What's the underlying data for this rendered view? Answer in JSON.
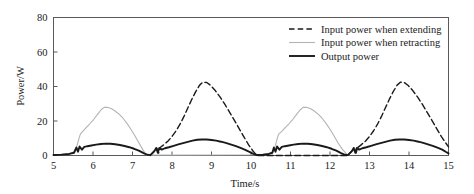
{
  "chart_data": {
    "type": "line",
    "title": "",
    "xlabel": "Time/s",
    "ylabel": "Power/W",
    "xlim": [
      5,
      15
    ],
    "ylim": [
      0,
      80
    ],
    "xticks": [
      "5",
      "6",
      "7",
      "8",
      "9",
      "10",
      "11",
      "12",
      "13",
      "14",
      "15"
    ],
    "yticks": [
      "0",
      "20",
      "40",
      "60",
      "80"
    ],
    "grid": false,
    "legend_position": "top-right",
    "legend": [
      {
        "label": "Input power when extending",
        "style": "dashed",
        "color": "#1a1a1a",
        "width": 1.4
      },
      {
        "label": "Input power when retracting",
        "style": "solid",
        "color": "#b3b3b3",
        "width": 1.1
      },
      {
        "label": "Output power",
        "style": "solid",
        "color": "#1a1a1a",
        "width": 1.9
      }
    ],
    "series": [
      {
        "name": "Input power when extending",
        "style": "dashed",
        "color": "#1a1a1a",
        "comment": "Active only during extension strokes: 7.45-10.15 and 12.45-15.0; peak about 42.5 W",
        "points": [
          [
            7.45,
            0.0
          ],
          [
            7.55,
            2.6
          ],
          [
            7.62,
            4.0
          ],
          [
            7.66,
            1.4
          ],
          [
            7.7,
            4.6
          ],
          [
            7.78,
            6.0
          ],
          [
            7.9,
            8.4
          ],
          [
            8.0,
            11.0
          ],
          [
            8.1,
            14.2
          ],
          [
            8.2,
            18.0
          ],
          [
            8.3,
            22.5
          ],
          [
            8.4,
            27.5
          ],
          [
            8.5,
            32.5
          ],
          [
            8.6,
            37.0
          ],
          [
            8.7,
            40.8
          ],
          [
            8.78,
            42.5
          ],
          [
            8.88,
            42.3
          ],
          [
            8.98,
            40.6
          ],
          [
            9.1,
            37.5
          ],
          [
            9.22,
            33.8
          ],
          [
            9.34,
            29.6
          ],
          [
            9.46,
            25.0
          ],
          [
            9.58,
            20.4
          ],
          [
            9.7,
            15.6
          ],
          [
            9.82,
            10.8
          ],
          [
            9.94,
            6.2
          ],
          [
            10.05,
            2.6
          ],
          [
            10.15,
            0.0
          ],
          [
            12.45,
            0.0
          ],
          [
            12.55,
            2.6
          ],
          [
            12.62,
            4.0
          ],
          [
            12.66,
            1.4
          ],
          [
            12.7,
            4.6
          ],
          [
            12.78,
            6.0
          ],
          [
            12.9,
            8.4
          ],
          [
            13.0,
            11.0
          ],
          [
            13.1,
            14.2
          ],
          [
            13.2,
            18.0
          ],
          [
            13.3,
            22.5
          ],
          [
            13.4,
            27.5
          ],
          [
            13.5,
            32.5
          ],
          [
            13.6,
            37.0
          ],
          [
            13.7,
            40.8
          ],
          [
            13.78,
            42.5
          ],
          [
            13.88,
            42.3
          ],
          [
            13.98,
            40.6
          ],
          [
            14.1,
            37.5
          ],
          [
            14.22,
            33.8
          ],
          [
            14.34,
            29.6
          ],
          [
            14.46,
            25.0
          ],
          [
            14.58,
            20.4
          ],
          [
            14.7,
            15.6
          ],
          [
            14.82,
            11.0
          ],
          [
            14.92,
            7.6
          ],
          [
            15.0,
            5.0
          ]
        ]
      },
      {
        "name": "Input power when retracting",
        "style": "solid",
        "color": "#b3b3b3",
        "comment": "Active during retraction strokes: 5.0-7.35 and 10.15-12.45; peak about 28 W",
        "points": [
          [
            5.0,
            0.4
          ],
          [
            5.2,
            0.6
          ],
          [
            5.4,
            1.0
          ],
          [
            5.52,
            2.2
          ],
          [
            5.6,
            6.0
          ],
          [
            5.64,
            9.5
          ],
          [
            5.68,
            12.4
          ],
          [
            5.74,
            14.0
          ],
          [
            5.82,
            16.0
          ],
          [
            5.92,
            18.4
          ],
          [
            6.02,
            21.0
          ],
          [
            6.12,
            24.0
          ],
          [
            6.2,
            26.4
          ],
          [
            6.28,
            27.9
          ],
          [
            6.36,
            28.0
          ],
          [
            6.46,
            27.2
          ],
          [
            6.56,
            25.8
          ],
          [
            6.66,
            24.0
          ],
          [
            6.76,
            21.6
          ],
          [
            6.86,
            18.6
          ],
          [
            6.96,
            15.2
          ],
          [
            7.06,
            11.4
          ],
          [
            7.16,
            7.4
          ],
          [
            7.26,
            3.4
          ],
          [
            7.35,
            0.2
          ],
          [
            10.15,
            0.4
          ],
          [
            10.3,
            0.6
          ],
          [
            10.45,
            1.0
          ],
          [
            10.56,
            2.2
          ],
          [
            10.62,
            6.0
          ],
          [
            10.66,
            9.5
          ],
          [
            10.7,
            12.4
          ],
          [
            10.78,
            14.0
          ],
          [
            10.86,
            16.0
          ],
          [
            10.96,
            18.4
          ],
          [
            11.06,
            21.0
          ],
          [
            11.16,
            24.0
          ],
          [
            11.24,
            26.4
          ],
          [
            11.32,
            27.9
          ],
          [
            11.4,
            28.0
          ],
          [
            11.5,
            27.2
          ],
          [
            11.6,
            25.8
          ],
          [
            11.7,
            24.0
          ],
          [
            11.8,
            21.6
          ],
          [
            11.9,
            18.6
          ],
          [
            12.0,
            15.2
          ],
          [
            12.1,
            11.4
          ],
          [
            12.2,
            7.4
          ],
          [
            12.32,
            3.4
          ],
          [
            12.45,
            0.2
          ]
        ]
      },
      {
        "name": "Output power",
        "style": "solid",
        "color": "#1a1a1a",
        "comment": "Continuous across both strokes; retract peaks about 7 W, extend peaks about 9.3 W",
        "points": [
          [
            5.0,
            0.3
          ],
          [
            5.2,
            0.5
          ],
          [
            5.4,
            0.9
          ],
          [
            5.52,
            1.6
          ],
          [
            5.58,
            4.6
          ],
          [
            5.62,
            2.2
          ],
          [
            5.66,
            5.2
          ],
          [
            5.72,
            3.4
          ],
          [
            5.78,
            5.0
          ],
          [
            5.86,
            5.4
          ],
          [
            5.96,
            5.8
          ],
          [
            6.08,
            6.3
          ],
          [
            6.2,
            6.7
          ],
          [
            6.32,
            6.9
          ],
          [
            6.44,
            6.8
          ],
          [
            6.56,
            6.5
          ],
          [
            6.68,
            6.1
          ],
          [
            6.8,
            5.5
          ],
          [
            6.92,
            4.8
          ],
          [
            7.04,
            3.9
          ],
          [
            7.16,
            2.8
          ],
          [
            7.28,
            1.4
          ],
          [
            7.38,
            0.4
          ],
          [
            7.45,
            0.2
          ],
          [
            7.55,
            2.4
          ],
          [
            7.6,
            4.4
          ],
          [
            7.64,
            1.6
          ],
          [
            7.68,
            4.4
          ],
          [
            7.74,
            3.4
          ],
          [
            7.82,
            4.2
          ],
          [
            7.92,
            4.8
          ],
          [
            8.04,
            5.6
          ],
          [
            8.16,
            6.4
          ],
          [
            8.28,
            7.2
          ],
          [
            8.4,
            7.9
          ],
          [
            8.52,
            8.6
          ],
          [
            8.64,
            9.1
          ],
          [
            8.76,
            9.3
          ],
          [
            8.88,
            9.3
          ],
          [
            9.0,
            9.0
          ],
          [
            9.12,
            8.6
          ],
          [
            9.24,
            8.0
          ],
          [
            9.36,
            7.3
          ],
          [
            9.48,
            6.5
          ],
          [
            9.6,
            5.6
          ],
          [
            9.72,
            4.5
          ],
          [
            9.84,
            3.4
          ],
          [
            9.96,
            2.1
          ],
          [
            10.06,
            1.0
          ],
          [
            10.15,
            0.3
          ],
          [
            10.3,
            0.5
          ],
          [
            10.45,
            0.9
          ],
          [
            10.54,
            1.6
          ],
          [
            10.58,
            4.6
          ],
          [
            10.62,
            2.2
          ],
          [
            10.66,
            5.2
          ],
          [
            10.72,
            3.4
          ],
          [
            10.78,
            5.0
          ],
          [
            10.86,
            5.4
          ],
          [
            10.96,
            5.8
          ],
          [
            11.08,
            6.3
          ],
          [
            11.2,
            6.7
          ],
          [
            11.32,
            6.9
          ],
          [
            11.44,
            6.8
          ],
          [
            11.56,
            6.5
          ],
          [
            11.68,
            6.1
          ],
          [
            11.8,
            5.5
          ],
          [
            11.92,
            4.8
          ],
          [
            12.04,
            3.9
          ],
          [
            12.16,
            2.8
          ],
          [
            12.28,
            1.4
          ],
          [
            12.38,
            0.4
          ],
          [
            12.45,
            0.2
          ],
          [
            12.55,
            2.4
          ],
          [
            12.6,
            4.4
          ],
          [
            12.64,
            1.6
          ],
          [
            12.68,
            4.4
          ],
          [
            12.74,
            3.4
          ],
          [
            12.82,
            4.2
          ],
          [
            12.92,
            4.8
          ],
          [
            13.04,
            5.6
          ],
          [
            13.16,
            6.4
          ],
          [
            13.28,
            7.2
          ],
          [
            13.4,
            7.9
          ],
          [
            13.52,
            8.6
          ],
          [
            13.64,
            9.1
          ],
          [
            13.76,
            9.3
          ],
          [
            13.88,
            9.3
          ],
          [
            14.0,
            9.0
          ],
          [
            14.12,
            8.6
          ],
          [
            14.24,
            8.0
          ],
          [
            14.36,
            7.3
          ],
          [
            14.48,
            6.5
          ],
          [
            14.6,
            5.6
          ],
          [
            14.72,
            4.5
          ],
          [
            14.84,
            3.4
          ],
          [
            14.94,
            2.0
          ],
          [
            15.0,
            1.2
          ]
        ]
      }
    ]
  }
}
